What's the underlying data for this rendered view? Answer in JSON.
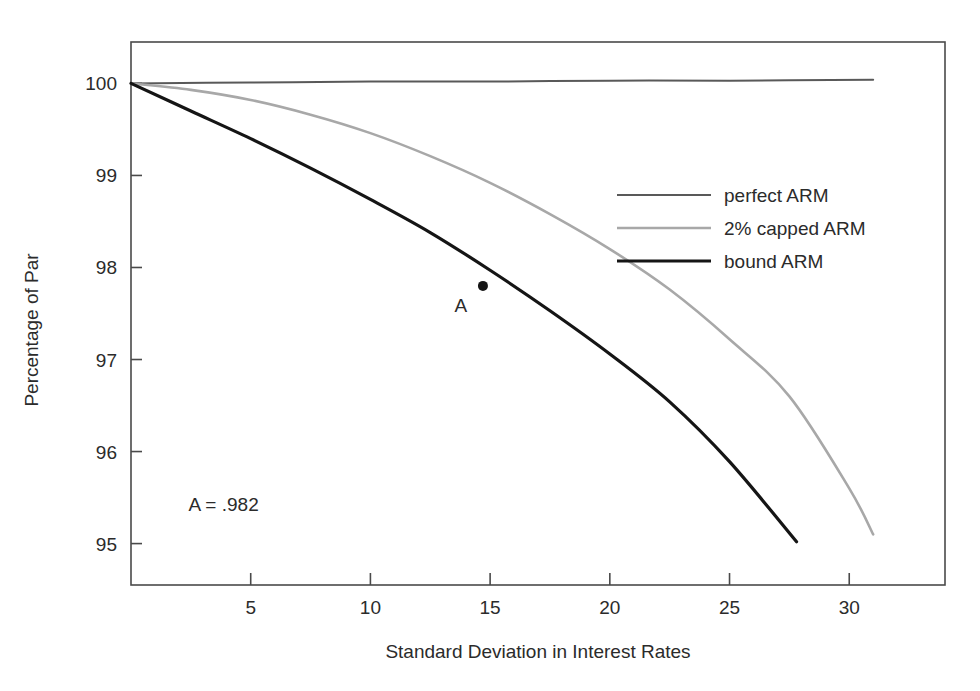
{
  "chart_data": {
    "type": "line",
    "title": "",
    "xlabel": "Standard Deviation in Interest Rates",
    "ylabel": "Percentage of Par",
    "xlim": [
      0,
      34
    ],
    "ylim": [
      94.55,
      100.45
    ],
    "xticks": [
      5,
      10,
      15,
      20,
      25,
      30
    ],
    "yticks": [
      95,
      96,
      97,
      98,
      99,
      100
    ],
    "xtick_labels": [
      "5",
      "10",
      "15",
      "20",
      "25",
      "30"
    ],
    "ytick_labels": [
      "95",
      "96",
      "97",
      "98",
      "99",
      "100"
    ],
    "grid": false,
    "frame": true,
    "legend_position": "upper-right-inside",
    "series": [
      {
        "name": "perfect ARM",
        "color": "#595959",
        "width": 2.0,
        "x": [
          0,
          5,
          10,
          15,
          20,
          25,
          31
        ],
        "y": [
          100.0,
          100.01,
          100.02,
          100.02,
          100.03,
          100.03,
          100.04
        ]
      },
      {
        "name": "2% capped ARM",
        "color": "#a8a8a8",
        "width": 2.6,
        "x": [
          0,
          2.5,
          5,
          7.5,
          10,
          12.5,
          15,
          17.5,
          20,
          22.5,
          25,
          27.5,
          30,
          31
        ],
        "y": [
          100.0,
          99.93,
          99.82,
          99.66,
          99.46,
          99.21,
          98.92,
          98.58,
          98.2,
          97.76,
          97.22,
          96.6,
          95.6,
          95.1
        ]
      },
      {
        "name": "bound ARM",
        "color": "#151515",
        "width": 3.2,
        "x": [
          0,
          2.5,
          5,
          7.5,
          10,
          12.5,
          15,
          17.5,
          20,
          22.5,
          25,
          27.8
        ],
        "y": [
          100.0,
          99.7,
          99.4,
          99.08,
          98.74,
          98.38,
          97.97,
          97.53,
          97.06,
          96.54,
          95.89,
          95.02
        ]
      }
    ],
    "annotations": [
      {
        "name": "point-a",
        "label": "A",
        "x": 14.7,
        "y": 97.8,
        "marker": "dot",
        "marker_color": "#151515",
        "label_dx": -22,
        "label_dy": 26
      },
      {
        "name": "a-value-note",
        "label": "A = .982",
        "x": 2.4,
        "y": 95.35,
        "marker": "none"
      }
    ],
    "legend_entries": [
      {
        "label": "perfect ARM",
        "color": "#595959",
        "width": 2.0
      },
      {
        "label": "2% capped ARM",
        "color": "#a8a8a8",
        "width": 2.6
      },
      {
        "label": "bound ARM",
        "color": "#151515",
        "width": 3.2
      }
    ]
  },
  "figure": {
    "background": "#ffffff",
    "frame_color": "#4a4a4a",
    "tick_color": "#4a4a4a",
    "text_color": "#2b2b2b"
  }
}
